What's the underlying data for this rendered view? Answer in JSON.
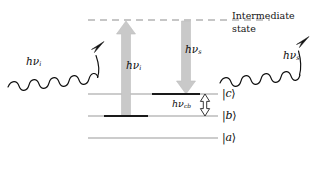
{
  "figure": {
    "kind": "energy-level-diagram",
    "background_color": "#ffffff",
    "line_color": "#8e8e8e",
    "thick_level_color": "#1a1a1a",
    "block_arrow_color": "#c9c9c9",
    "block_arrow_edge_color": "#b6b6b6",
    "wave_color": "#111111",
    "text_color": "#0d0d0d"
  },
  "intermediate": {
    "label_line1": "Intermediate",
    "label_line2": "state",
    "style": "dashed",
    "y": 20,
    "x_start": 88,
    "x_end": 270
  },
  "levels": [
    {
      "id": "c",
      "ket": "|c⟩",
      "ket_symbol_open": "|",
      "ket_letter": "c",
      "ket_symbol_close": "⟩",
      "y": 94,
      "x_start": 88,
      "x_end": 218,
      "thick_from": 152,
      "thick_to": 200
    },
    {
      "id": "b",
      "ket": "|b⟩",
      "ket_symbol_open": "|",
      "ket_letter": "b",
      "ket_symbol_close": "⟩",
      "y": 116,
      "x_start": 88,
      "x_end": 218,
      "thick_from": 104,
      "thick_to": 148
    },
    {
      "id": "a",
      "ket": "|a⟩",
      "ket_symbol_open": "|",
      "ket_letter": "a",
      "ket_symbol_close": "⟩",
      "y": 138,
      "x_start": 88,
      "x_end": 218,
      "thick_from": null,
      "thick_to": null
    }
  ],
  "transitions": {
    "pump_up": {
      "label_prefix": "hν",
      "label_sub": "i",
      "direction": "up",
      "from_level": "b",
      "to_level": "intermediate",
      "x": 126,
      "y_tail": 116,
      "y_head": 21
    },
    "stokes_down": {
      "label_prefix": "hν",
      "label_sub": "s",
      "direction": "down",
      "from_level": "intermediate",
      "to_level": "c",
      "x": 186,
      "y_tail": 21,
      "y_head": 94
    },
    "splitting": {
      "label_prefix": "hν",
      "label_sub": "cb",
      "direction": "double",
      "between": [
        "c",
        "b"
      ],
      "x": 205,
      "y_top": 94,
      "y_bottom": 116
    }
  },
  "photons": [
    {
      "id": "incident",
      "label_prefix": "hν",
      "label_sub": "i",
      "side": "left",
      "arrow_direction": "up-right",
      "x_start": 8,
      "y_start": 86,
      "x_end": 103,
      "y_end": 42
    },
    {
      "id": "scattered",
      "label_prefix": "hν",
      "label_sub": "s",
      "side": "right",
      "arrow_direction": "up-right",
      "x_start": 218,
      "y_start": 82,
      "x_end": 308,
      "y_end": 37
    }
  ]
}
